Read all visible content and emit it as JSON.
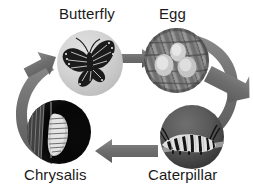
{
  "diagram": {
    "background_color": "#ffffff",
    "arrow_color": "#707070",
    "label_color": "#1a1a1a",
    "stages": [
      {
        "id": "butterfly",
        "label": "Butterfly",
        "order": 1,
        "photo_name": "butterfly-photo",
        "photo_description": "monarch butterfly on pale gray background",
        "circle": {
          "cx": 90,
          "cy": 63,
          "r": 33
        }
      },
      {
        "id": "egg",
        "label": "Egg",
        "order": 2,
        "photo_name": "egg-photo",
        "photo_description": "pale eggs on a textured leaf",
        "circle": {
          "cx": 176,
          "cy": 60,
          "r": 32
        }
      },
      {
        "id": "caterpillar",
        "label": "Caterpillar",
        "order": 3,
        "photo_name": "caterpillar-photo",
        "photo_description": "striped monarch caterpillar on a stem",
        "circle": {
          "cx": 192,
          "cy": 137,
          "r": 32
        }
      },
      {
        "id": "chrysalis",
        "label": "Chrysalis",
        "order": 4,
        "photo_name": "chrysalis-photo",
        "photo_description": "chrysalis hanging against a black background",
        "circle": {
          "cx": 59,
          "cy": 132,
          "r": 32
        }
      }
    ],
    "arrows": [
      {
        "id": "butterfly-to-egg",
        "from": "butterfly",
        "to": "egg",
        "direction": "right",
        "shape": "straight"
      },
      {
        "id": "egg-to-caterpillar",
        "from": "egg",
        "to": "caterpillar",
        "direction": "down-right",
        "shape": "curved"
      },
      {
        "id": "caterpillar-to-chrysalis",
        "from": "caterpillar",
        "to": "chrysalis",
        "direction": "left",
        "shape": "straight"
      },
      {
        "id": "chrysalis-to-butterfly",
        "from": "chrysalis",
        "to": "butterfly",
        "direction": "up-right",
        "shape": "curved"
      }
    ]
  }
}
